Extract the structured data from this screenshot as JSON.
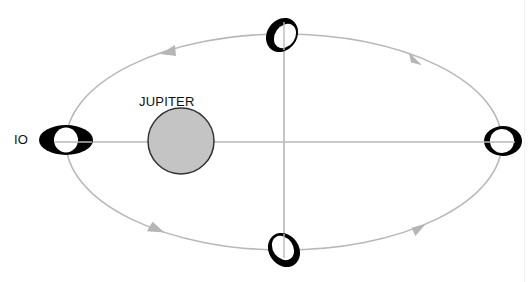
{
  "labels": {
    "moon": "IO",
    "planet": "JUPITER"
  },
  "colors": {
    "orbit": "#b8b8b8",
    "axes": "#b8b8b8",
    "planet_fill": "#c4c4c4",
    "planet_stroke": "#333333",
    "moon_dark": "#000000",
    "moon_light": "#ffffff",
    "arrow": "#b5b5b5"
  },
  "orbit": {
    "cx": 284,
    "cy": 142,
    "rx": 218,
    "ry": 108,
    "direction": "counterclockwise"
  },
  "planet": {
    "name": "JUPITER",
    "cx": 181,
    "cy": 141,
    "r": 33
  },
  "moon_positions": [
    {
      "position": "left",
      "cx": 66,
      "cy": 140,
      "label": "IO"
    },
    {
      "position": "top",
      "cx": 282,
      "cy": 35
    },
    {
      "position": "bottom",
      "cx": 284,
      "cy": 250
    },
    {
      "position": "right",
      "cx": 503,
      "cy": 141
    }
  ],
  "arrows": [
    {
      "position": "top-left",
      "x": 170,
      "y": 50
    },
    {
      "position": "top-right",
      "x": 416,
      "y": 60
    },
    {
      "position": "bottom-left",
      "x": 160,
      "y": 230
    },
    {
      "position": "bottom-right",
      "x": 420,
      "y": 228
    }
  ]
}
